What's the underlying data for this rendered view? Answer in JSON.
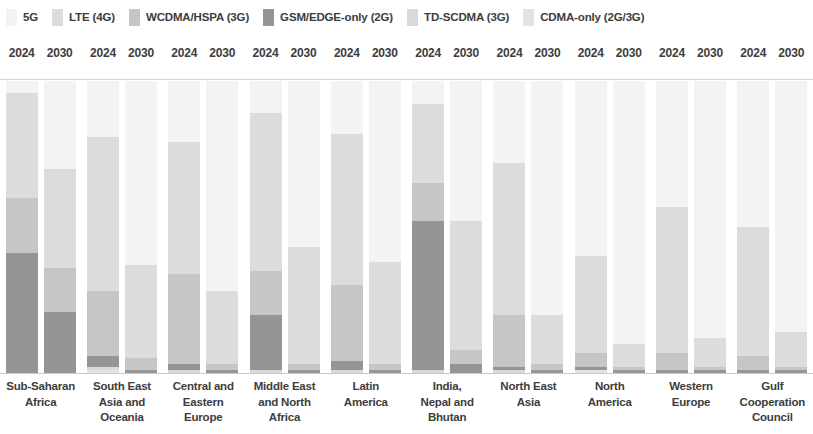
{
  "legend": {
    "items": [
      {
        "label": "5G",
        "color": "#f3f3f3",
        "icon": "legend-swatch-5g"
      },
      {
        "label": "LTE (4G)",
        "color": "#dcdcdc",
        "icon": "legend-swatch-lte"
      },
      {
        "label": "WCDMA/HSPA (3G)",
        "color": "#c6c6c6",
        "icon": "legend-swatch-wcdma"
      },
      {
        "label": "GSM/EDGE-only (2G)",
        "color": "#959595",
        "icon": "legend-swatch-gsm"
      },
      {
        "label": "TD-SCDMA (3G)",
        "color": "#d9d9d9",
        "icon": "legend-swatch-tdscdma"
      },
      {
        "label": "CDMA-only (2G/3G)",
        "color": "#e3e3e3",
        "icon": "legend-swatch-cdma"
      }
    ]
  },
  "chart_data": {
    "type": "bar",
    "subtype": "100% stacked column",
    "title": "",
    "xlabel": "",
    "ylabel": "",
    "ylim": [
      0,
      100
    ],
    "grid": false,
    "legend_position": "top",
    "years": [
      "2024",
      "2030"
    ],
    "categories": [
      "Sub-Saharan Africa",
      "South East Asia and Oceania",
      "Central and Eastern Europe",
      "Middle East and North Africa",
      "Latin America",
      "India, Nepal and Bhutan",
      "North East Asia",
      "North America",
      "Western Europe",
      "Gulf Cooperation Council"
    ],
    "category_lines": [
      [
        "Sub-Saharan",
        "Africa"
      ],
      [
        "South East",
        "Asia and",
        "Oceania"
      ],
      [
        "Central and",
        "Eastern",
        "Europe"
      ],
      [
        "Middle East",
        "and North",
        "Africa"
      ],
      [
        "Latin",
        "America"
      ],
      [
        "India,",
        "Nepal and",
        "Bhutan"
      ],
      [
        "North East",
        "Asia"
      ],
      [
        "North",
        "America"
      ],
      [
        "Western",
        "Europe"
      ],
      [
        "Gulf",
        "Cooperation",
        "Council"
      ]
    ],
    "series": [
      {
        "name": "5G",
        "color": "#f3f3f3",
        "values_2024": [
          4,
          19,
          21,
          11,
          18,
          8,
          28,
          60,
          43,
          50
        ],
        "values_2030": [
          30,
          63,
          72,
          57,
          62,
          48,
          80,
          90,
          88,
          86
        ]
      },
      {
        "name": "LTE (4G)",
        "color": "#dcdcdc",
        "values_2024": [
          36,
          53,
          45,
          54,
          52,
          27,
          52,
          33,
          50,
          44
        ],
        "values_2030": [
          34,
          32,
          25,
          40,
          35,
          44,
          17,
          8,
          10,
          12
        ]
      },
      {
        "name": "WCDMA/HSPA (3G)",
        "color": "#c6c6c6",
        "values_2024": [
          19,
          22,
          31,
          15,
          26,
          13,
          18,
          5,
          6,
          5
        ],
        "values_2030": [
          15,
          4,
          2,
          2,
          2,
          5,
          2,
          1,
          1,
          1
        ]
      },
      {
        "name": "GSM/EDGE-only (2G)",
        "color": "#959595",
        "values_2024": [
          41,
          4,
          2,
          19,
          3,
          51,
          1,
          1,
          1,
          1
        ],
        "values_2030": [
          21,
          1,
          1,
          1,
          1,
          3,
          1,
          1,
          1,
          1
        ]
      },
      {
        "name": "TD-SCDMA (3G)",
        "color": "#d9d9d9",
        "values_2024": [
          0,
          1,
          1,
          1,
          1,
          1,
          1,
          0,
          0,
          0
        ],
        "values_2030": [
          0,
          0,
          0,
          0,
          0,
          0,
          0,
          0,
          0,
          0
        ]
      },
      {
        "name": "CDMA-only (2G/3G)",
        "color": "#e3e3e3",
        "values_2024": [
          0,
          1,
          0,
          0,
          0,
          0,
          0,
          1,
          0,
          0
        ],
        "values_2030": [
          0,
          0,
          0,
          0,
          0,
          0,
          0,
          0,
          0,
          0
        ]
      }
    ]
  }
}
